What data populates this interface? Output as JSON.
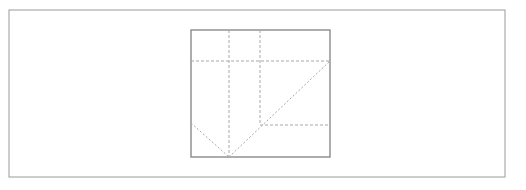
{
  "figure": {
    "title": "",
    "background_color": "#ffffff",
    "width": 526,
    "height": 190,
    "outer_frame": {
      "name": "outer-frame",
      "x": 9,
      "y": 10,
      "width": 496,
      "height": 167,
      "stroke_color": "#9a9a9a",
      "stroke_width": 1,
      "fill": "none"
    },
    "inner_square": {
      "name": "inner-square",
      "x": 191,
      "y": 30,
      "width": 139,
      "height": 127,
      "stroke_color": "#8a8a8a",
      "stroke_width": 1.4,
      "fill": "none"
    },
    "dashed_style": {
      "stroke_color": "#a8a8a8",
      "stroke_width": 1,
      "dash_pattern": "3,2"
    },
    "solid_diagonal_style": {
      "stroke_color": "#a8a8a8",
      "stroke_width": 1,
      "dash_pattern": "2,2"
    },
    "lines": [
      {
        "name": "dashed-vertical-left",
        "kind": "dashed-vertical",
        "x1": 229,
        "y1": 30,
        "x2": 229,
        "y2": 157
      },
      {
        "name": "dashed-vertical-right",
        "kind": "dashed-vertical",
        "x1": 260,
        "y1": 30,
        "x2": 260,
        "y2": 125
      },
      {
        "name": "dashed-horizontal-upper",
        "kind": "dashed-horizontal",
        "x1": 191,
        "y1": 61,
        "x2": 330,
        "y2": 61
      },
      {
        "name": "dashed-horizontal-lower",
        "kind": "dashed-horizontal",
        "x1": 260,
        "y1": 125,
        "x2": 330,
        "y2": 125
      },
      {
        "name": "diagonal-main-ascending",
        "kind": "diagonal",
        "x1": 229,
        "y1": 157,
        "x2": 330,
        "y2": 61
      },
      {
        "name": "diagonal-left-descending",
        "kind": "diagonal",
        "x1": 191,
        "y1": 123,
        "x2": 229,
        "y2": 157
      }
    ],
    "vertices": [
      {
        "name": "apex-vertex",
        "x": 229,
        "y": 157
      },
      {
        "name": "diagonal-top-right-vertex",
        "x": 330,
        "y": 61
      },
      {
        "name": "diagonal-left-start-vertex",
        "x": 191,
        "y": 123
      },
      {
        "name": "diagonal-crossing-vertex",
        "x": 260,
        "y": 125
      }
    ]
  }
}
